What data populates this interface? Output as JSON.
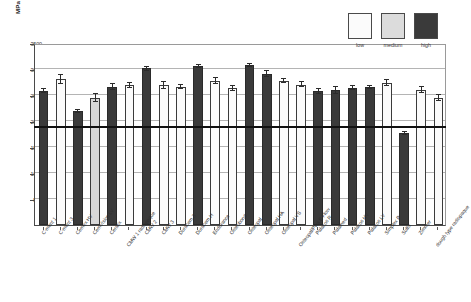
{
  "chart_data": {
    "type": "bar",
    "title": "",
    "xlabel": "",
    "ylabel": "MPa",
    "ylim": [
      0,
      3500
    ],
    "yticks": [
      500,
      1000,
      1500,
      2000,
      2500,
      3000,
      3500
    ],
    "ytick_labels": [
      "500",
      "1000",
      "1500",
      "2000",
      "2500",
      "3000",
      "3500"
    ],
    "grid": true,
    "legend_position": "top-right",
    "reference_line": {
      "value": 1870,
      "label": ""
    },
    "legend": [
      {
        "key": "low",
        "label": "low",
        "color": "#fbfbfb"
      },
      {
        "key": "medium",
        "label": "medium",
        "color": "#dcdcdc"
      },
      {
        "key": "high",
        "label": "high",
        "color": "#3a3a3a"
      }
    ],
    "categories": [
      "C-ment 1",
      "C-ment 3",
      "Cemex HV",
      "CemVision LV",
      "Cerafix",
      "CMW 1 radiopaque",
      "CMW 2",
      "CMW 3",
      "Duracem 3",
      "Duracem H",
      "Endurance",
      "Osteobond",
      "Osteopal",
      "Osteopal HA",
      "Osteopal VS",
      "Osteopal/Plus E Flow",
      "Palacos R",
      "Palamed",
      "Palacos HV",
      "Palacos LV",
      "Simplex P",
      "Sulfix",
      "Zimmer",
      "dough type radiopaque"
    ],
    "groups": [
      "high",
      "low",
      "high",
      "medium",
      "high",
      "low",
      "high",
      "low",
      "low",
      "high",
      "low",
      "low",
      "high",
      "high",
      "low",
      "low",
      "high",
      "high",
      "high",
      "high",
      "low",
      "high",
      "low",
      "low"
    ],
    "values": [
      2580,
      2800,
      2190,
      2440,
      2650,
      2690,
      3010,
      2690,
      2650,
      3050,
      2770,
      2630,
      3070,
      2910,
      2770,
      2700,
      2570,
      2590,
      2640,
      2650,
      2730,
      1760,
      2600,
      2440
    ],
    "errors": [
      45,
      80,
      25,
      75,
      55,
      50,
      40,
      65,
      40,
      35,
      60,
      55,
      30,
      55,
      45,
      50,
      55,
      60,
      40,
      25,
      55,
      30,
      50,
      60
    ]
  }
}
